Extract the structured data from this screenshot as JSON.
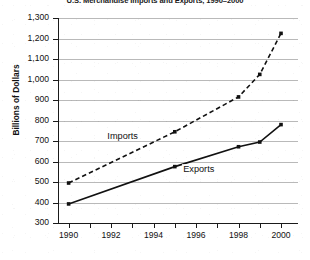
{
  "chart_data": {
    "type": "line",
    "title": "U.S. Merchandise Imports and Exports, 1990–2000",
    "xlabel": "",
    "ylabel": "Billions of Dollars",
    "ylim": [
      300,
      1300
    ],
    "xlim": [
      1989.5,
      2000.8
    ],
    "grid": true,
    "legend_position": "inline-annotation",
    "y_ticks": [
      "300",
      "400",
      "500",
      "600",
      "700",
      "800",
      "900",
      "1,000",
      "1,100",
      "1,200",
      "1,300"
    ],
    "y_tick_values": [
      300,
      400,
      500,
      600,
      700,
      800,
      900,
      1000,
      1100,
      1200,
      1300
    ],
    "x_ticks": [
      "1990",
      "1992",
      "1994",
      "1996",
      "1998",
      "2000"
    ],
    "x_tick_values": [
      1990,
      1992,
      1994,
      1996,
      1998,
      2000
    ],
    "x_minor_ticks": [
      1991,
      1993,
      1995,
      1997,
      1999
    ],
    "series": [
      {
        "name": "Imports",
        "style": "dashed",
        "color": "#111111",
        "marker": "square",
        "x": [
          1990,
          1995,
          1998,
          1999,
          2000
        ],
        "values": [
          495,
          745,
          915,
          1025,
          1225
        ]
      },
      {
        "name": "Exports",
        "style": "solid",
        "color": "#111111",
        "marker": "square",
        "x": [
          1990,
          1995,
          1998,
          1999,
          2000
        ],
        "values": [
          393,
          575,
          672,
          695,
          780
        ]
      }
    ],
    "annotations": [
      {
        "text": "Imports",
        "x": 1993.0,
        "y": 720
      },
      {
        "text": "Exports",
        "x": 1996.1,
        "y": 560
      }
    ]
  }
}
